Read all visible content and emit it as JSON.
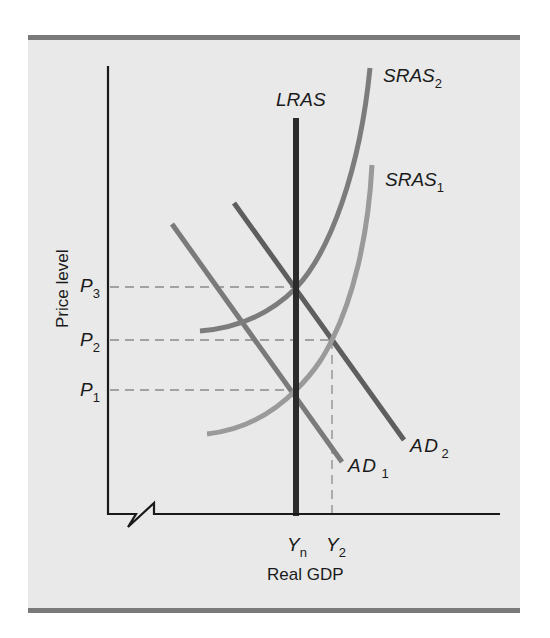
{
  "diagram": {
    "type": "AD-AS model",
    "axes": {
      "y_title": "Price level",
      "x_title": "Real GDP",
      "y_ticks": [
        {
          "main": "P",
          "sub": "3"
        },
        {
          "main": "P",
          "sub": "2"
        },
        {
          "main": "P",
          "sub": "1"
        }
      ],
      "x_ticks": [
        {
          "main": "Y",
          "sub": "n"
        },
        {
          "main": "Y",
          "sub": "2"
        }
      ]
    },
    "curves": {
      "lras": {
        "label": "LRAS",
        "sub": ""
      },
      "sras2": {
        "label": "SRAS",
        "sub": "2"
      },
      "sras1": {
        "label": "SRAS",
        "sub": "1"
      },
      "ad2": {
        "label": "AD",
        "sub": "2"
      },
      "ad1": {
        "label": "AD",
        "sub": "1"
      }
    },
    "colors": {
      "panel_bg": "#e9e9e9",
      "band": "#7a7a7a",
      "axis": "#1a1a1a",
      "lras": "#2b2b2b",
      "sras2": "#7c7c7c",
      "sras1": "#9a9a9a",
      "ad2": "#5e5e5e",
      "ad1": "#7a7a7a",
      "guide": "#8a8a8a"
    }
  }
}
